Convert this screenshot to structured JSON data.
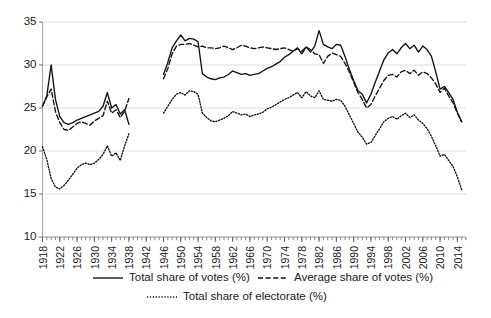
{
  "chart_data": {
    "type": "line",
    "title": "",
    "subtitle": "",
    "xlabel": "",
    "ylabel": "",
    "xlim": [
      1918,
      2016
    ],
    "ylim": [
      10,
      35
    ],
    "yticks": [
      10,
      15,
      20,
      25,
      30,
      35
    ],
    "ytick_labels": [
      "10",
      "15",
      "20",
      "25",
      "30",
      "35"
    ],
    "xticks": [
      1918,
      1922,
      1926,
      1930,
      1934,
      1938,
      1942,
      1946,
      1950,
      1954,
      1958,
      1962,
      1966,
      1970,
      1974,
      1978,
      1982,
      1986,
      1990,
      1994,
      1998,
      2002,
      2006,
      2010,
      2014
    ],
    "xtick_labels": [
      "1918",
      "1922",
      "1926",
      "1930",
      "1934",
      "1938",
      "1942",
      "1946",
      "1950",
      "1954",
      "1958",
      "1962",
      "1966",
      "1970",
      "1974",
      "1978",
      "1982",
      "1986",
      "1990",
      "1994",
      "1998",
      "2002",
      "2006",
      "2010",
      "2014"
    ],
    "minor_xticks_every": 1,
    "grid": "horizontal",
    "legend_position": "bottom",
    "data_gap_years": [
      1939,
      1940,
      1941,
      1942,
      1943,
      1944,
      1945
    ],
    "series": [
      {
        "name": "Total share of votes (%)",
        "style": "solid",
        "color": "#111111",
        "x": [
          1918,
          1919,
          1920,
          1921,
          1922,
          1923,
          1924,
          1925,
          1926,
          1927,
          1928,
          1929,
          1930,
          1931,
          1932,
          1933,
          1934,
          1935,
          1936,
          1937,
          1938,
          1946,
          1947,
          1948,
          1949,
          1950,
          1951,
          1952,
          1953,
          1954,
          1955,
          1956,
          1957,
          1958,
          1959,
          1960,
          1961,
          1962,
          1963,
          1964,
          1965,
          1966,
          1967,
          1968,
          1969,
          1970,
          1971,
          1972,
          1973,
          1974,
          1975,
          1976,
          1977,
          1978,
          1979,
          1980,
          1981,
          1982,
          1983,
          1984,
          1985,
          1986,
          1987,
          1988,
          1989,
          1990,
          1991,
          1992,
          1993,
          1994,
          1995,
          1996,
          1997,
          1998,
          1999,
          2000,
          2001,
          2002,
          2003,
          2004,
          2005,
          2006,
          2007,
          2008,
          2009,
          2010,
          2011,
          2012,
          2013,
          2014,
          2015
        ],
        "y": [
          25.2,
          26.4,
          30.0,
          26.0,
          24.0,
          23.3,
          23.1,
          23.3,
          23.6,
          23.8,
          24.0,
          24.2,
          24.4,
          24.6,
          25.2,
          26.8,
          25.0,
          25.4,
          24.3,
          24.8,
          23.1,
          28.9,
          30.3,
          32.0,
          32.8,
          33.5,
          32.8,
          33.1,
          33.0,
          32.7,
          29.0,
          28.6,
          28.4,
          28.3,
          28.5,
          28.6,
          28.9,
          29.3,
          29.1,
          28.9,
          29.0,
          28.8,
          28.9,
          29.0,
          29.3,
          29.6,
          29.8,
          30.1,
          30.4,
          30.9,
          31.2,
          31.6,
          32.0,
          31.3,
          32.1,
          31.5,
          32.2,
          34.0,
          32.4,
          32.1,
          31.9,
          32.4,
          32.3,
          31.0,
          29.5,
          28.2,
          27.0,
          26.6,
          25.6,
          26.6,
          28.0,
          29.3,
          30.6,
          31.4,
          31.8,
          31.3,
          32.0,
          32.5,
          31.9,
          32.3,
          31.5,
          32.2,
          31.8,
          31.0,
          29.2,
          27.2,
          27.5,
          26.8,
          26.0,
          24.5,
          23.4
        ]
      },
      {
        "name": "Average share of votes (%)",
        "style": "dashed",
        "color": "#111111",
        "x": [
          1918,
          1919,
          1920,
          1921,
          1922,
          1923,
          1924,
          1925,
          1926,
          1927,
          1928,
          1929,
          1930,
          1931,
          1932,
          1933,
          1934,
          1935,
          1936,
          1937,
          1938,
          1946,
          1947,
          1948,
          1949,
          1950,
          1951,
          1952,
          1953,
          1954,
          1955,
          1956,
          1957,
          1958,
          1959,
          1960,
          1961,
          1962,
          1963,
          1964,
          1965,
          1966,
          1967,
          1968,
          1969,
          1970,
          1971,
          1972,
          1973,
          1974,
          1975,
          1976,
          1977,
          1978,
          1979,
          1980,
          1981,
          1982,
          1983,
          1984,
          1985,
          1986,
          1987,
          1988,
          1989,
          1990,
          1991,
          1992,
          1993,
          1994,
          1995,
          1996,
          1997,
          1998,
          1999,
          2000,
          2001,
          2002,
          2003,
          2004,
          2005,
          2006,
          2007,
          2008,
          2009,
          2010,
          2011,
          2012,
          2013,
          2014,
          2015
        ],
        "y": [
          25.2,
          26.3,
          27.2,
          24.6,
          23.3,
          22.5,
          22.4,
          22.8,
          23.2,
          23.4,
          23.2,
          23.0,
          23.5,
          23.8,
          24.1,
          25.8,
          24.4,
          24.8,
          23.9,
          24.6,
          26.1,
          28.4,
          29.6,
          31.3,
          32.2,
          32.4,
          32.4,
          32.5,
          32.3,
          32.1,
          32.2,
          32.0,
          32.0,
          31.9,
          32.0,
          32.2,
          32.0,
          31.8,
          32.0,
          32.3,
          32.2,
          32.0,
          31.9,
          32.0,
          32.1,
          32.0,
          31.9,
          31.8,
          31.9,
          32.0,
          31.8,
          31.6,
          31.9,
          31.6,
          32.1,
          31.8,
          31.3,
          31.2,
          30.2,
          31.0,
          31.4,
          31.2,
          31.0,
          30.2,
          29.2,
          28.0,
          26.8,
          26.0,
          25.0,
          25.4,
          26.4,
          27.3,
          28.2,
          28.8,
          28.9,
          28.6,
          29.2,
          29.4,
          29.0,
          29.4,
          28.8,
          29.2,
          29.0,
          28.5,
          27.8,
          26.8,
          27.3,
          26.4,
          25.6,
          24.4,
          23.4
        ]
      },
      {
        "name": "Total share of electorate (%)",
        "style": "dotted",
        "color": "#111111",
        "x": [
          1918,
          1919,
          1920,
          1921,
          1922,
          1923,
          1924,
          1925,
          1926,
          1927,
          1928,
          1929,
          1930,
          1931,
          1932,
          1933,
          1934,
          1935,
          1936,
          1937,
          1938,
          1946,
          1947,
          1948,
          1949,
          1950,
          1951,
          1952,
          1953,
          1954,
          1955,
          1956,
          1957,
          1958,
          1959,
          1960,
          1961,
          1962,
          1963,
          1964,
          1965,
          1966,
          1967,
          1968,
          1969,
          1970,
          1971,
          1972,
          1973,
          1974,
          1975,
          1976,
          1977,
          1978,
          1979,
          1980,
          1981,
          1982,
          1983,
          1984,
          1985,
          1986,
          1987,
          1988,
          1989,
          1990,
          1991,
          1992,
          1993,
          1994,
          1995,
          1996,
          1997,
          1998,
          1999,
          2000,
          2001,
          2002,
          2003,
          2004,
          2005,
          2006,
          2007,
          2008,
          2009,
          2010,
          2011,
          2012,
          2013,
          2014,
          2015
        ],
        "y": [
          20.5,
          19.0,
          16.8,
          15.8,
          15.6,
          16.0,
          16.6,
          17.3,
          18.0,
          18.4,
          18.6,
          18.4,
          18.6,
          19.0,
          19.6,
          20.6,
          19.4,
          19.8,
          18.9,
          20.6,
          22.0,
          24.4,
          25.2,
          26.0,
          26.6,
          26.8,
          26.5,
          27.0,
          26.9,
          26.6,
          24.4,
          23.9,
          23.5,
          23.4,
          23.6,
          23.8,
          24.1,
          24.6,
          24.4,
          24.2,
          24.3,
          24.0,
          24.2,
          24.3,
          24.5,
          24.9,
          25.1,
          25.4,
          25.7,
          26.0,
          26.2,
          26.5,
          26.8,
          26.2,
          26.9,
          26.4,
          26.2,
          27.0,
          26.0,
          25.9,
          25.8,
          26.0,
          25.9,
          25.2,
          24.2,
          23.2,
          22.2,
          21.6,
          20.8,
          21.0,
          21.8,
          22.6,
          23.4,
          23.8,
          24.0,
          23.7,
          24.1,
          24.4,
          23.9,
          24.2,
          23.6,
          23.2,
          22.6,
          21.7,
          20.6,
          19.4,
          19.6,
          18.9,
          18.2,
          17.0,
          15.5
        ]
      }
    ],
    "legend": [
      {
        "label": "Total share of votes (%)",
        "style": "solid"
      },
      {
        "label": "Average share of votes (%)",
        "style": "dashed"
      },
      {
        "label": "Total share of electorate (%)",
        "style": "dotted"
      }
    ]
  }
}
